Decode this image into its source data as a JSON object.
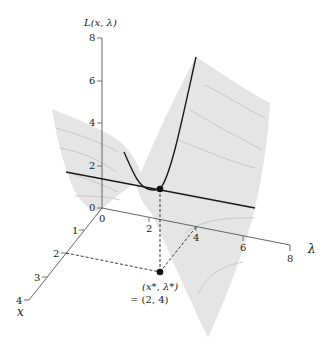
{
  "figure": {
    "type": "3d-surface-diagram",
    "z_axis": {
      "label": "L(x, λ)",
      "ticks": [
        "0",
        "2",
        "4",
        "6",
        "8"
      ]
    },
    "lambda_axis": {
      "label": "λ",
      "ticks": [
        "0",
        "2",
        "4",
        "6",
        "8"
      ]
    },
    "x_axis": {
      "label": "x",
      "ticks": [
        "1",
        "2",
        "3",
        "4"
      ]
    },
    "saddle_point": {
      "label_line1": "(x*, λ*)",
      "label_line2": "= (2, 4)",
      "x": 2,
      "lambda": 4
    },
    "colors": {
      "surface": "#e5e5e5",
      "contour": "#c2c2c2",
      "curve": "#1a1a1a",
      "axis": "#555555"
    }
  }
}
